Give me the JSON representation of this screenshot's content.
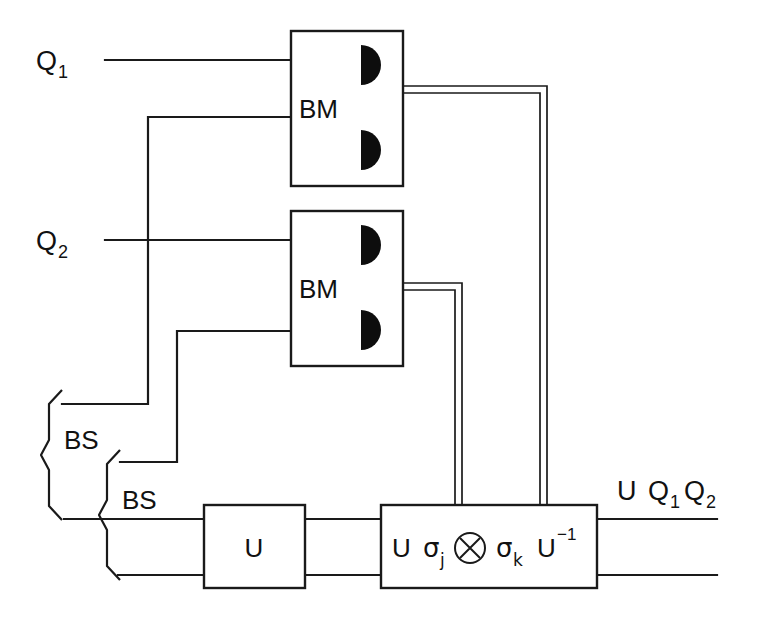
{
  "diagram": {
    "background_color": "#ffffff",
    "line_color": "#1a1a1a",
    "inputs": [
      {
        "id": "q1",
        "label": "Q",
        "subscript": "1"
      },
      {
        "id": "q2",
        "label": "Q",
        "subscript": "2"
      }
    ],
    "measurement_boxes": [
      {
        "id": "bm-top",
        "label": "BM",
        "detectors": 2
      },
      {
        "id": "bm-bottom",
        "label": "BM",
        "detectors": 2
      }
    ],
    "beamsplitters": [
      {
        "id": "bs-upper",
        "label": "BS"
      },
      {
        "id": "bs-lower",
        "label": "BS"
      }
    ],
    "gates": [
      {
        "id": "u-gate",
        "label": "U"
      },
      {
        "id": "correction-gate",
        "prefix": "U",
        "sigma_j": "σ",
        "sigma_j_sub": "j",
        "tensor": "⊗",
        "sigma_k": "σ",
        "sigma_k_sub": "k",
        "suffix": "U",
        "suffix_sup": "−1"
      }
    ],
    "output": {
      "u": "U",
      "q1": "Q",
      "q1_sub": "1",
      "q2": "Q",
      "q2_sub": "2"
    }
  }
}
